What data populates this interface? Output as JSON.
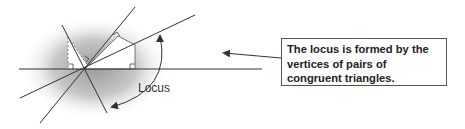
{
  "diagram": {
    "label_locus": "Locus",
    "callout_text": "The locus is formed by the vertices of pairs of congruent triangles.",
    "colors": {
      "line": "#333333",
      "shade": "#bdbdbd",
      "box_border": "#555555",
      "text": "#222222"
    }
  }
}
